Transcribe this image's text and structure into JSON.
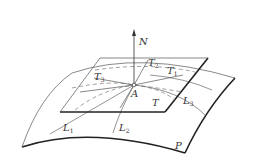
{
  "figure": {
    "colors": {
      "stroke": "#222222",
      "thin": "#555555",
      "dashed": "#777777",
      "text": "#333333"
    },
    "labels": {
      "N": {
        "base": "N",
        "sub": ""
      },
      "T1": {
        "base": "T",
        "sub": "1"
      },
      "T2": {
        "base": "T",
        "sub": "2"
      },
      "T3": {
        "base": "T",
        "sub": "3"
      },
      "A": {
        "base": "A",
        "sub": ""
      },
      "T": {
        "base": "T",
        "sub": ""
      },
      "L1": {
        "base": "L",
        "sub": "1"
      },
      "L2": {
        "base": "L",
        "sub": "2"
      },
      "L3": {
        "base": "L",
        "sub": "3"
      },
      "P": {
        "base": "P",
        "sub": ""
      }
    }
  }
}
